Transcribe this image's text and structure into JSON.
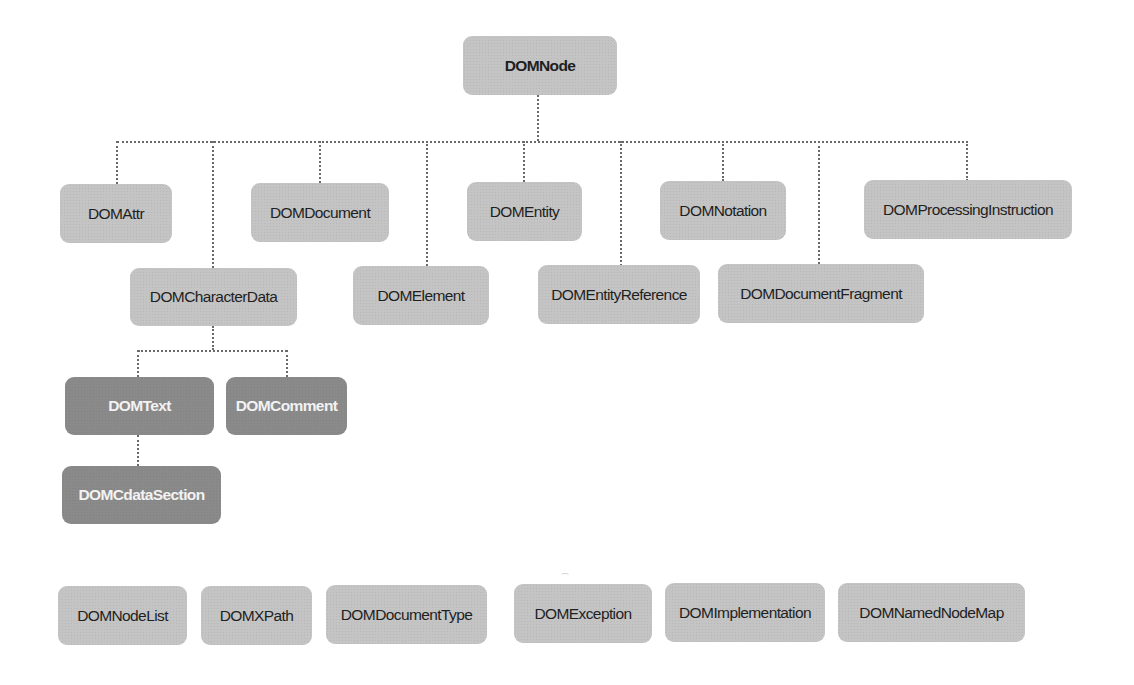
{
  "diagram": {
    "root": {
      "label": "DOMNode"
    },
    "children_row1": [
      {
        "id": "attr",
        "label": "DOMAttr"
      },
      {
        "id": "document",
        "label": "DOMDocument"
      },
      {
        "id": "entity",
        "label": "DOMEntity"
      },
      {
        "id": "notation",
        "label": "DOMNotation"
      },
      {
        "id": "processing_instruction",
        "label": "DOMProcessingInstruction"
      }
    ],
    "children_row2": [
      {
        "id": "character_data",
        "label": "DOMCharacterData"
      },
      {
        "id": "element",
        "label": "DOMElement"
      },
      {
        "id": "entity_reference",
        "label": "DOMEntityReference"
      },
      {
        "id": "document_fragment",
        "label": "DOMDocumentFragment"
      }
    ],
    "character_data_children": [
      {
        "id": "text",
        "label": "DOMText"
      },
      {
        "id": "comment",
        "label": "DOMComment"
      }
    ],
    "text_children": [
      {
        "id": "cdata_section",
        "label": "DOMCdataSection"
      }
    ],
    "standalone": [
      {
        "id": "node_list",
        "label": "DOMNodeList"
      },
      {
        "id": "xpath",
        "label": "DOMXPath"
      },
      {
        "id": "document_type",
        "label": "DOMDocumentType"
      },
      {
        "id": "exception",
        "label": "DOMException"
      },
      {
        "id": "implementation",
        "label": "DOMImplementation"
      },
      {
        "id": "named_node_map",
        "label": "DOMNamedNodeMap"
      }
    ],
    "colors": {
      "node_light": "#c4c4c4",
      "node_dark": "#8a8a8a",
      "connector": "#6a6a6a",
      "background": "#ffffff"
    }
  }
}
